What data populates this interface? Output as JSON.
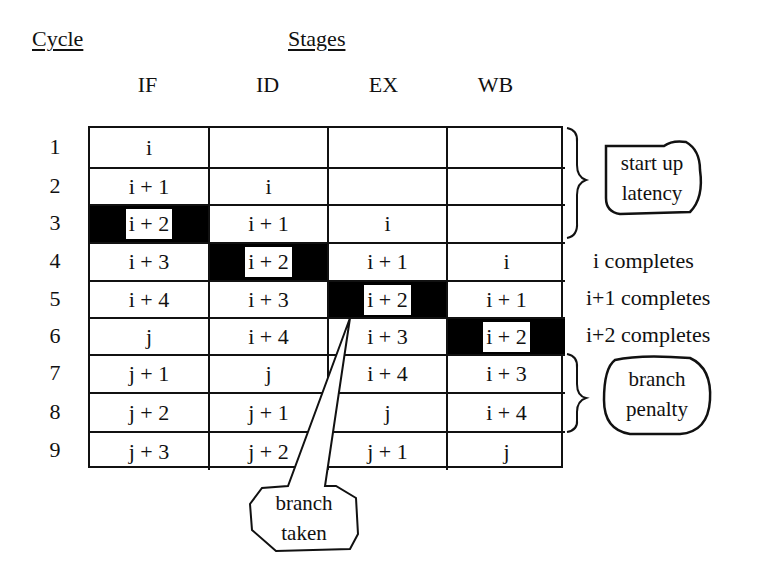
{
  "headers": {
    "cycle": "Cycle",
    "stages": "Stages"
  },
  "stages": [
    "IF",
    "ID",
    "EX",
    "WB"
  ],
  "rows": [
    {
      "cycle": "1",
      "cells": [
        "i",
        "",
        "",
        ""
      ]
    },
    {
      "cycle": "2",
      "cells": [
        "i + 1",
        "i",
        "",
        ""
      ]
    },
    {
      "cycle": "3",
      "cells": [
        "i + 2",
        "i + 1",
        "i",
        ""
      ]
    },
    {
      "cycle": "4",
      "cells": [
        "i + 3",
        "i + 2",
        "i + 1",
        "i"
      ]
    },
    {
      "cycle": "5",
      "cells": [
        "i + 4",
        "i + 3",
        "i + 2",
        "i + 1"
      ]
    },
    {
      "cycle": "6",
      "cells": [
        "j",
        "i + 4",
        "i + 3",
        "i + 2"
      ]
    },
    {
      "cycle": "7",
      "cells": [
        "j + 1",
        "j",
        "i + 4",
        "i + 3"
      ]
    },
    {
      "cycle": "8",
      "cells": [
        "j + 2",
        "j + 1",
        "j",
        "i + 4"
      ]
    },
    {
      "cycle": "9",
      "cells": [
        "j + 3",
        "j + 2",
        "j + 1",
        "j"
      ]
    }
  ],
  "highlighted": [
    [
      2,
      0
    ],
    [
      3,
      1
    ],
    [
      4,
      2
    ],
    [
      5,
      3
    ]
  ],
  "annotations": {
    "startup_line1": "start up",
    "startup_line2": "latency",
    "complete_4": "i completes",
    "complete_5": "i+1 completes",
    "complete_6": "i+2 completes",
    "penalty_line1": "branch",
    "penalty_line2": "penalty",
    "taken_line1": "branch",
    "taken_line2": "taken"
  }
}
